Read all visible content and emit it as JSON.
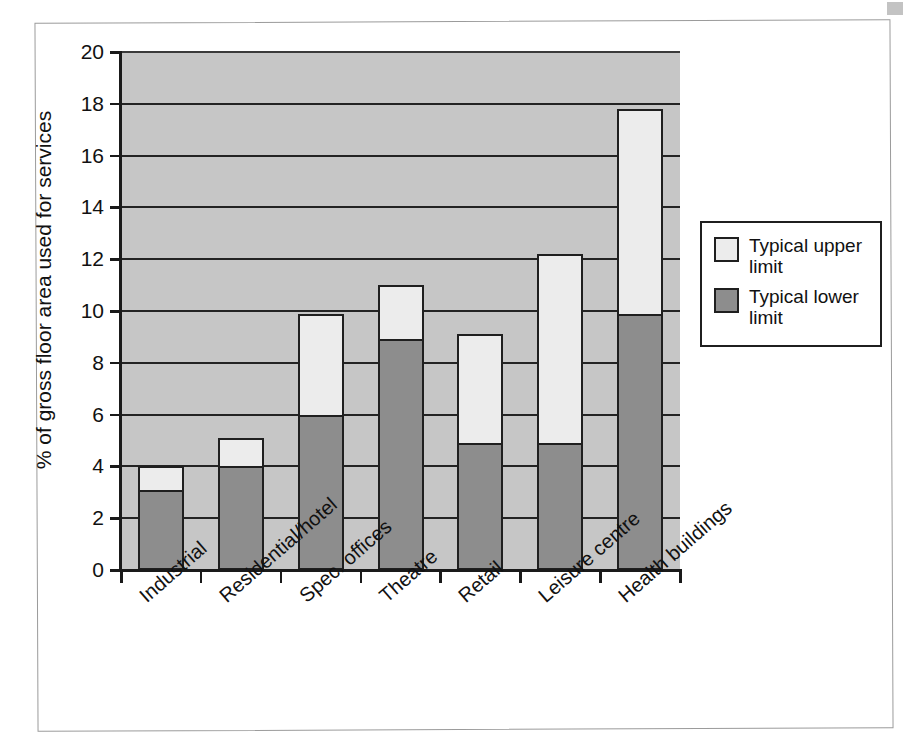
{
  "figure": {
    "frame_visible": true,
    "background": "#ffffff",
    "scan_mark": "scan-artifact"
  },
  "chart_data": {
    "type": "bar",
    "subtype": "stacked-range",
    "title": "",
    "xlabel": "",
    "ylabel": "% of gross floor area used for services",
    "ylim": [
      0,
      20
    ],
    "ytick_step": 2,
    "yticks": [
      "0",
      "2",
      "4",
      "6",
      "8",
      "10",
      "12",
      "14",
      "16",
      "18",
      "20"
    ],
    "grid": true,
    "grid_axis": "y",
    "legend_position": "right",
    "plot_background": "#c6c6c6",
    "categories": [
      "Industrial",
      "Residential/hotel",
      "Spec. offices",
      "Theatre",
      "Retail",
      "Leisure centre",
      "Health buildings"
    ],
    "series": [
      {
        "name": "Typical lower limit",
        "color": "#8d8d8d",
        "values": [
          3.1,
          4.0,
          6.0,
          8.9,
          4.9,
          4.9,
          9.9
        ]
      },
      {
        "name": "Typical upper limit",
        "color": "#ececec",
        "values": [
          4.0,
          5.1,
          9.9,
          11.0,
          9.1,
          12.2,
          17.8
        ]
      }
    ],
    "legend": [
      {
        "label_line1": "Typical upper",
        "label_line2": "limit",
        "swatch": "#ececec"
      },
      {
        "label_line1": "Typical lower",
        "label_line2": "limit",
        "swatch": "#8d8d8d"
      }
    ]
  }
}
